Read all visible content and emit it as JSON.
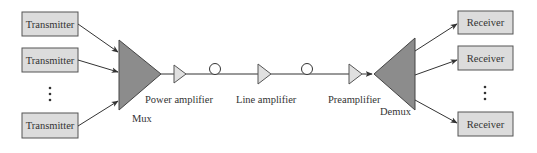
{
  "diagram": {
    "colors": {
      "box_fill": "#dcdcdc",
      "box_stroke": "#555555",
      "mux_fill": "#8c8c8c",
      "amp_fill": "#e0e0e0",
      "line": "#333333"
    },
    "transmitters": [
      {
        "label": "Transmitter"
      },
      {
        "label": "Transmitter"
      },
      {
        "label": "Transmitter"
      }
    ],
    "transmitter_ellipsis": "⋮",
    "mux": {
      "label": "Mux"
    },
    "stages": [
      {
        "label": "Power amplifier"
      },
      {
        "label": "Line amplifier"
      },
      {
        "label": "Preamplifier"
      }
    ],
    "fiber_spools": 2,
    "demux": {
      "label": "Demux"
    },
    "receivers": [
      {
        "label": "Receiver"
      },
      {
        "label": "Receiver"
      },
      {
        "label": "Receiver"
      }
    ],
    "receiver_ellipsis": "⋮"
  }
}
